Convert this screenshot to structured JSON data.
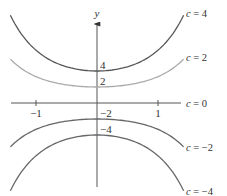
{
  "chart_data": {
    "type": "line",
    "title": "",
    "xlabel": "",
    "ylabel": "y",
    "function": "y = c * exp(x^2 / 2)",
    "x_range": [
      -1.42,
      1.42
    ],
    "xlim": [
      -1.42,
      1.36
    ],
    "ylim": [
      -10.5,
      11.0
    ],
    "grid": false,
    "x_ticks": [
      {
        "value": -1,
        "label": "−1"
      },
      {
        "value": 1,
        "label": "1"
      }
    ],
    "series": [
      {
        "name": "c = 4",
        "c": 4,
        "color": "#555555",
        "intercept_label": "4"
      },
      {
        "name": "c = 2",
        "c": 2,
        "color": "#aaaaaa",
        "intercept_label": "2"
      },
      {
        "name": "c = 0",
        "c": 0,
        "color": "#555555",
        "intercept_label": ""
      },
      {
        "name": "c = −2",
        "c": -2,
        "color": "#666666",
        "intercept_label": "−2"
      },
      {
        "name": "c = −4",
        "c": -4,
        "color": "#666666",
        "intercept_label": "−4"
      }
    ],
    "legend": "right-of-curve-ends"
  }
}
